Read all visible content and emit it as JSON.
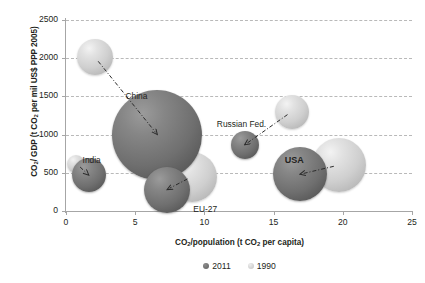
{
  "chart_data": {
    "type": "scatter",
    "title": "",
    "xlabel": "CO2/population (t CO2 per capita)",
    "ylabel": "CO2/ GDP (t CO2 per mil US$ PPP 2005)",
    "xlim": [
      0,
      25
    ],
    "ylim": [
      0,
      2500
    ],
    "xticks": [
      "0",
      "5",
      "10",
      "15",
      "20",
      "25"
    ],
    "yticks": [
      "0",
      "500",
      "1000",
      "1500",
      "2000",
      "2500"
    ],
    "grid": "horizontal-dashed",
    "legend_position": "bottom-center",
    "legend": [
      {
        "label": "2011",
        "color": "#6f6f6f",
        "style": "dark"
      },
      {
        "label": "1990",
        "color": "#cfcfcf",
        "style": "light"
      }
    ],
    "bubble_size_encodes": "total CO2 emissions",
    "points": [
      {
        "name": "China",
        "series": "1990",
        "x": 2.1,
        "y": 2010,
        "r": 18
      },
      {
        "name": "China",
        "series": "2011",
        "x": 6.6,
        "y": 1000,
        "r": 45
      },
      {
        "name": "India",
        "series": "1990",
        "x": 0.75,
        "y": 620,
        "r": 9
      },
      {
        "name": "India",
        "series": "2011",
        "x": 1.65,
        "y": 470,
        "r": 17
      },
      {
        "name": "EU-27",
        "series": "1990",
        "x": 9.1,
        "y": 450,
        "r": 25
      },
      {
        "name": "EU-27",
        "series": "2011",
        "x": 7.3,
        "y": 280,
        "r": 23
      },
      {
        "name": "Russian Fed.",
        "series": "1990",
        "x": 16.3,
        "y": 1300,
        "r": 17
      },
      {
        "name": "Russian Fed.",
        "series": "2011",
        "x": 12.9,
        "y": 865,
        "r": 14
      },
      {
        "name": "USA",
        "series": "1990",
        "x": 19.7,
        "y": 600,
        "r": 27
      },
      {
        "name": "USA",
        "series": "2011",
        "x": 16.9,
        "y": 480,
        "r": 27
      }
    ],
    "annotations": [
      {
        "label": "China",
        "x": 4.3,
        "y": 1490,
        "bold": false
      },
      {
        "label": "India",
        "x": 1.2,
        "y": 660,
        "bold": false
      },
      {
        "label": "EU-27",
        "x": 9.2,
        "y": 10,
        "bold": false
      },
      {
        "label": "Russian Fed.",
        "x": 10.9,
        "y": 1130,
        "bold": false
      },
      {
        "label": "USA",
        "x": 15.8,
        "y": 660,
        "bold": true
      }
    ],
    "arrows": [
      {
        "name": "china-trend-arrow",
        "from": [
          2.1,
          2010
        ],
        "to": [
          6.6,
          1000
        ]
      },
      {
        "name": "india-trend-arrow",
        "from": [
          0.75,
          620
        ],
        "to": [
          1.65,
          470
        ]
      },
      {
        "name": "eu27-trend-arrow",
        "from": [
          9.1,
          450
        ],
        "to": [
          7.3,
          280
        ]
      },
      {
        "name": "russia-trend-arrow",
        "from": [
          16.3,
          1300
        ],
        "to": [
          12.9,
          865
        ]
      },
      {
        "name": "usa-trend-arrow",
        "from": [
          19.7,
          600
        ],
        "to": [
          16.9,
          480
        ]
      }
    ]
  },
  "axis": {
    "x_title_html": "CO2/population (t CO2 per capita)",
    "y_title_html": "CO2/ GDP (t CO2 per mil US$ PPP 2005)"
  }
}
